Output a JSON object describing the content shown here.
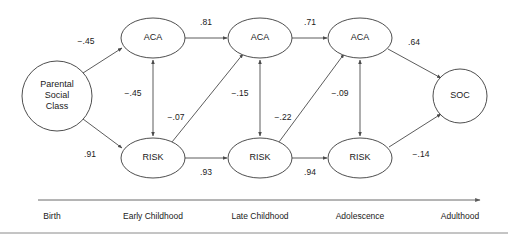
{
  "figure": {
    "type": "path-diagram",
    "background_color": "#ffffff",
    "stroke_color": "#4a4a4a",
    "text_color": "#1a1a1a"
  },
  "nodes": [
    {
      "id": "psc",
      "label": "Parental",
      "label_line2": "Social",
      "label_line3": "Class",
      "shape": "circle",
      "cx": 57,
      "cy": 96,
      "r": 35
    },
    {
      "id": "aca1",
      "label": "ACA",
      "shape": "ellipse",
      "cx": 153,
      "cy": 38,
      "rx": 32,
      "ry": 20
    },
    {
      "id": "aca2",
      "label": "ACA",
      "shape": "ellipse",
      "cx": 260,
      "cy": 38,
      "rx": 32,
      "ry": 20
    },
    {
      "id": "aca3",
      "label": "ACA",
      "shape": "ellipse",
      "cx": 360,
      "cy": 38,
      "rx": 32,
      "ry": 20
    },
    {
      "id": "risk1",
      "label": "RISK",
      "shape": "ellipse",
      "cx": 153,
      "cy": 158,
      "rx": 32,
      "ry": 20
    },
    {
      "id": "risk2",
      "label": "RISK",
      "shape": "ellipse",
      "cx": 260,
      "cy": 158,
      "rx": 32,
      "ry": 20
    },
    {
      "id": "risk3",
      "label": "RISK",
      "shape": "ellipse",
      "cx": 360,
      "cy": 158,
      "rx": 32,
      "ry": 20
    },
    {
      "id": "soc",
      "label": "SOC",
      "shape": "circle",
      "cx": 460,
      "cy": 96,
      "r": 27
    }
  ],
  "edges": [
    {
      "id": "psc-aca1",
      "from": "psc",
      "to": "aca1",
      "coefficient": "−.45",
      "label_x": 86,
      "label_y": 42,
      "arrow": "single"
    },
    {
      "id": "psc-risk1",
      "from": "psc",
      "to": "risk1",
      "coefficient": ".91",
      "label_x": 90,
      "label_y": 155,
      "arrow": "single"
    },
    {
      "id": "aca1-aca2",
      "from": "aca1",
      "to": "aca2",
      "coefficient": ".81",
      "label_x": 206,
      "label_y": 23,
      "arrow": "single"
    },
    {
      "id": "aca2-aca3",
      "from": "aca2",
      "to": "aca3",
      "coefficient": ".71",
      "label_x": 310,
      "label_y": 23,
      "arrow": "single"
    },
    {
      "id": "risk1-risk2",
      "from": "risk1",
      "to": "risk2",
      "coefficient": ".93",
      "label_x": 206,
      "label_y": 173,
      "arrow": "single"
    },
    {
      "id": "risk2-risk3",
      "from": "risk2",
      "to": "risk3",
      "coefficient": ".94",
      "label_x": 310,
      "label_y": 173,
      "arrow": "single"
    },
    {
      "id": "aca1-risk1",
      "from": "aca1",
      "to": "risk1",
      "coefficient": "−.45",
      "label_x": 133,
      "label_y": 94,
      "arrow": "double"
    },
    {
      "id": "aca2-risk2",
      "from": "aca2",
      "to": "risk2",
      "coefficient": "−.15",
      "label_x": 240,
      "label_y": 94,
      "arrow": "double"
    },
    {
      "id": "aca3-risk3",
      "from": "aca3",
      "to": "risk3",
      "coefficient": "−.09",
      "label_x": 340,
      "label_y": 94,
      "arrow": "double"
    },
    {
      "id": "risk1-aca2",
      "from": "risk1",
      "to": "aca2",
      "coefficient": "−.07",
      "label_x": 176,
      "label_y": 118,
      "arrow": "single"
    },
    {
      "id": "risk2-aca3",
      "from": "risk2",
      "to": "aca3",
      "coefficient": "−.22",
      "label_x": 283,
      "label_y": 118,
      "arrow": "single"
    },
    {
      "id": "aca3-soc",
      "from": "aca3",
      "to": "soc",
      "coefficient": ".64",
      "label_x": 414,
      "label_y": 43,
      "arrow": "single"
    },
    {
      "id": "risk3-soc",
      "from": "risk3",
      "to": "soc",
      "coefficient": "−.14",
      "label_x": 421,
      "label_y": 155,
      "arrow": "single"
    }
  ],
  "timeline": {
    "axis_start_x": 38,
    "axis_end_x": 480,
    "axis_y": 200,
    "label_y": 216,
    "stages": [
      {
        "label": "Birth",
        "x": 52
      },
      {
        "label": "Early Childhood",
        "x": 153
      },
      {
        "label": "Late Childhood",
        "x": 260
      },
      {
        "label": "Adolescence",
        "x": 360
      },
      {
        "label": "Adulthood",
        "x": 460
      }
    ]
  },
  "frame": {
    "bottom_rule_y": 233
  }
}
